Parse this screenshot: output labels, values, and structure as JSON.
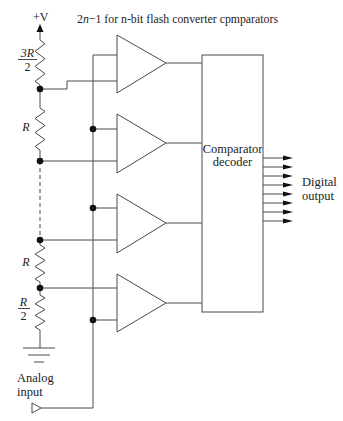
{
  "title": {
    "prefix": "2",
    "italic": "n",
    "suffix": "−1 for n-bit flash converter cpmparators"
  },
  "supply": {
    "label": "+V"
  },
  "resistors": [
    {
      "numerator": "3R",
      "denominator": "2"
    },
    {
      "label": "R"
    },
    {
      "label": "R"
    },
    {
      "numerator": "R",
      "denominator": "2"
    }
  ],
  "decoder": {
    "line1": "Comparator",
    "line2": "decoder"
  },
  "output": {
    "line1": "Digital",
    "line2": "output"
  },
  "input": {
    "line1": "Analog",
    "line2": "input"
  },
  "colors": {
    "wire": "#4a4a4a",
    "node": "#111111",
    "text": "#222222",
    "background": "#ffffff"
  }
}
